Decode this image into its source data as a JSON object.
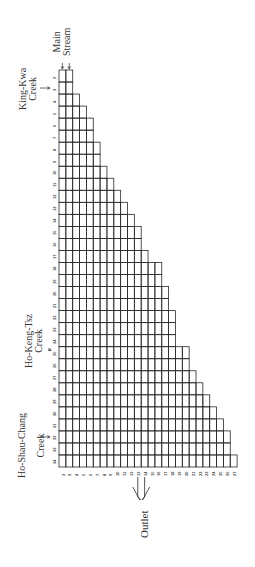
{
  "diagram": {
    "orientation": "rotated -90deg",
    "labels": {
      "main_stream": [
        "Main",
        "Stream"
      ],
      "king_kwa_creek": [
        "King-Kwa",
        "Creek"
      ],
      "ho_keng_tsz_creek": [
        "Ho-Keng-Tsz",
        "Creek"
      ],
      "ho_shau_chang_creek": [
        "Ho-Shau-Chang",
        "Creek"
      ],
      "outlet": "Outlet"
    },
    "row_labels": [
      "2",
      "3",
      "4",
      "5",
      "6",
      "7",
      "8",
      "9",
      "10",
      "11",
      "12",
      "13",
      "14",
      "15",
      "16",
      "17",
      "18",
      "19",
      "20",
      "21",
      "22",
      "23",
      "24",
      "25",
      "26",
      "27",
      "28",
      "29",
      "30",
      "31",
      "32",
      "33",
      "34"
    ],
    "column_labels": [
      "2",
      "3",
      "4",
      "5",
      "6",
      "7",
      "8",
      "9",
      "10",
      "11",
      "12",
      "13",
      "14",
      "15",
      "16",
      "17",
      "18",
      "19",
      "20",
      "21",
      "22",
      "23",
      "24",
      "25",
      "26",
      "27"
    ],
    "row_cell_counts": [
      2,
      2,
      3,
      4,
      5,
      5,
      6,
      6,
      7,
      8,
      9,
      10,
      11,
      12,
      12,
      13,
      15,
      15,
      16,
      16,
      17,
      17,
      17,
      19,
      19,
      20,
      21,
      22,
      23,
      24,
      25,
      25,
      26
    ],
    "tributary_inflow_rows": {
      "king_kwa_creek": "3",
      "ho_keng_tsz_creek": "25",
      "ho_shau_chang_creek": "32"
    },
    "outlet_columns": [
      "13",
      "14"
    ],
    "colors": {
      "grid_line": "#2a2a2a",
      "text": "#333333",
      "background": "#ffffff"
    }
  }
}
